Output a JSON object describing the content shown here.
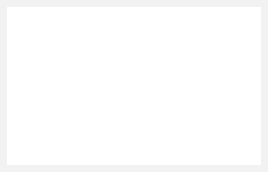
{
  "figure": {
    "background_color": "#ffffff",
    "frame_color": "#f2f2f2",
    "line_color": "#111111",
    "accent_color": "#2e2e2e"
  },
  "left_body": {
    "name": "left-roller",
    "center_label": "O",
    "center_sub": "1",
    "radius_px": 30,
    "center_x": 58,
    "center_y": 88,
    "internal_vectors": [
      {
        "label": "S",
        "sub": "1",
        "direction": "right",
        "name": "vector-s1-left-body"
      },
      {
        "label": "S",
        "sub": "2",
        "direction": "up",
        "name": "vector-s2-left-body"
      }
    ],
    "moment_arc": {
      "label": "L",
      "sub": "1",
      "style": "solid",
      "sense": "clockwise"
    },
    "angle_arc": {
      "label": "α",
      "sub": "1",
      "style": "dashed",
      "sense": "clockwise"
    }
  },
  "right_body": {
    "name": "right-roller",
    "center_label": "O",
    "center_sub": "2",
    "radius_px": 45,
    "center_x": 208,
    "center_y": 75,
    "internal_vectors": [
      {
        "label": "S",
        "sub": "2",
        "direction": "down",
        "name": "vector-s2-right-body"
      },
      {
        "label": "S",
        "sub": "1",
        "direction": "left",
        "name": "vector-s1-right-body"
      }
    ],
    "moment_arc": {
      "label": "L",
      "sub": "2",
      "style": "solid",
      "sense": "counterclockwise"
    },
    "angle_arc": {
      "label": "α",
      "sub": "2",
      "style": "dashed",
      "sense": "counterclockwise"
    }
  },
  "external_forces": [
    {
      "label": "R",
      "name": "reaction-left",
      "direction": "left",
      "applies_to": "left-roller"
    },
    {
      "label": "F",
      "name": "force-down-left",
      "direction": "down",
      "applies_to": "left-roller"
    },
    {
      "label": "R",
      "name": "reaction-right",
      "direction": "right",
      "applies_to": "right-roller"
    },
    {
      "label": "F",
      "name": "force-up-right",
      "direction": "up",
      "applies_to": "right-roller"
    }
  ],
  "labels": {
    "L1": "L",
    "L1_sub": "1",
    "L2": "L",
    "L2_sub": "2",
    "alpha1": "α",
    "alpha1_sub": "1",
    "alpha2": "α",
    "alpha2_sub": "2",
    "S1": "S",
    "S1_sub": "1",
    "S2": "S",
    "S2_sub": "2",
    "O1": "O",
    "O1_sub": "1",
    "O2": "O",
    "O2_sub": "2",
    "R_left": "R",
    "R_right": "R",
    "F_left": "F",
    "F_right": "F"
  }
}
